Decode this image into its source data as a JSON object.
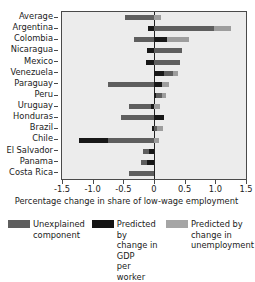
{
  "chart_data": {
    "type": "bar",
    "orientation": "horizontal",
    "stacked": true,
    "title": "",
    "xlabel": "Percentage change in share of low-wage employment",
    "ylabel": "",
    "xlim": [
      -1.5,
      1.5
    ],
    "xticks": [
      -1.5,
      -1.0,
      -0.5,
      0.0,
      0.5,
      1.0,
      1.5
    ],
    "xtick_labels": [
      "-1.5",
      "-1.0",
      "-0.5",
      "0",
      "0.5",
      "1.0",
      "1.5"
    ],
    "grid": false,
    "legend_position": "bottom",
    "zero_line": 0,
    "categories": [
      "Average",
      "Argentina",
      "Colombia",
      "Nicaragua",
      "Mexico",
      "Venezuela",
      "Paraguay",
      "Peru",
      "Uruguay",
      "Honduras",
      "Brazil",
      "Chile",
      "El Salvador",
      "Panama",
      "Costa Rica"
    ],
    "series": [
      {
        "name": "Unexplained component",
        "color": "#5e5e5e",
        "values": [
          -0.48,
          0.98,
          -0.33,
          0.45,
          0.42,
          0.31,
          -0.75,
          0.13,
          -0.4,
          -0.53,
          0.05,
          -0.75,
          -0.1,
          -0.09,
          -0.4
        ]
      },
      {
        "name": "Predicted by change in GDP per worker",
        "color": "#171717",
        "values": [
          0.0,
          -0.1,
          0.22,
          -0.12,
          -0.13,
          0.17,
          0.13,
          0.04,
          -0.05,
          0.16,
          -0.04,
          -0.47,
          -0.08,
          -0.12,
          0.0
        ]
      },
      {
        "name": "Predicted by change in unemployment",
        "color": "#9d9d9d",
        "values": [
          0.11,
          0.28,
          0.35,
          0.0,
          0.0,
          0.08,
          0.12,
          0.06,
          0.1,
          0.0,
          0.1,
          0.08,
          0.0,
          0.0,
          0.0
        ]
      }
    ],
    "bars": [
      {
        "category": "Average",
        "segments": [
          {
            "series": "Unexplained component",
            "start": -0.48,
            "end": 0.0
          },
          {
            "series": "Predicted by change in unemployment",
            "start": 0.0,
            "end": 0.11
          }
        ]
      },
      {
        "category": "Argentina",
        "segments": [
          {
            "series": "Predicted by change in GDP per worker",
            "start": -0.1,
            "end": 0.0
          },
          {
            "series": "Unexplained component",
            "start": 0.0,
            "end": 0.98
          },
          {
            "series": "Predicted by change in unemployment",
            "start": 0.98,
            "end": 1.26
          }
        ]
      },
      {
        "category": "Colombia",
        "segments": [
          {
            "series": "Unexplained component",
            "start": -0.33,
            "end": 0.0
          },
          {
            "series": "Predicted by change in GDP per worker",
            "start": 0.0,
            "end": 0.22
          },
          {
            "series": "Predicted by change in unemployment",
            "start": 0.22,
            "end": 0.57
          }
        ]
      },
      {
        "category": "Nicaragua",
        "segments": [
          {
            "series": "Predicted by change in GDP per worker",
            "start": -0.12,
            "end": 0.0
          },
          {
            "series": "Unexplained component",
            "start": 0.0,
            "end": 0.45
          }
        ]
      },
      {
        "category": "Mexico",
        "segments": [
          {
            "series": "Predicted by change in GDP per worker",
            "start": -0.13,
            "end": 0.0
          },
          {
            "series": "Unexplained component",
            "start": 0.0,
            "end": 0.42
          }
        ]
      },
      {
        "category": "Venezuela",
        "segments": [
          {
            "series": "Predicted by change in GDP per worker",
            "start": 0.0,
            "end": 0.17
          },
          {
            "series": "Unexplained component",
            "start": 0.17,
            "end": 0.31
          },
          {
            "series": "Predicted by change in unemployment",
            "start": 0.31,
            "end": 0.39
          }
        ]
      },
      {
        "category": "Paraguay",
        "segments": [
          {
            "series": "Unexplained component",
            "start": -0.75,
            "end": 0.0
          },
          {
            "series": "Predicted by change in GDP per worker",
            "start": 0.0,
            "end": 0.13
          },
          {
            "series": "Predicted by change in unemployment",
            "start": 0.13,
            "end": 0.25
          }
        ]
      },
      {
        "category": "Peru",
        "segments": [
          {
            "series": "Predicted by change in GDP per worker",
            "start": 0.0,
            "end": 0.04
          },
          {
            "series": "Unexplained component",
            "start": 0.04,
            "end": 0.13
          },
          {
            "series": "Predicted by change in unemployment",
            "start": 0.13,
            "end": 0.19
          }
        ]
      },
      {
        "category": "Uruguay",
        "segments": [
          {
            "series": "Unexplained component",
            "start": -0.4,
            "end": -0.05
          },
          {
            "series": "Predicted by change in GDP per worker",
            "start": -0.05,
            "end": 0.0
          },
          {
            "series": "Predicted by change in unemployment",
            "start": 0.0,
            "end": 0.1
          }
        ]
      },
      {
        "category": "Honduras",
        "segments": [
          {
            "series": "Unexplained component",
            "start": -0.53,
            "end": 0.0
          },
          {
            "series": "Predicted by change in GDP per worker",
            "start": 0.0,
            "end": 0.16
          }
        ]
      },
      {
        "category": "Brazil",
        "segments": [
          {
            "series": "Predicted by change in GDP per worker",
            "start": -0.04,
            "end": 0.0
          },
          {
            "series": "Unexplained component",
            "start": 0.0,
            "end": 0.05
          },
          {
            "series": "Predicted by change in unemployment",
            "start": 0.05,
            "end": 0.14
          }
        ]
      },
      {
        "category": "Chile",
        "segments": [
          {
            "series": "Predicted by change in GDP per worker",
            "start": -1.22,
            "end": -0.75
          },
          {
            "series": "Unexplained component",
            "start": -0.75,
            "end": 0.0
          },
          {
            "series": "Predicted by change in unemployment",
            "start": 0.0,
            "end": 0.08
          }
        ]
      },
      {
        "category": "El Salvador",
        "segments": [
          {
            "series": "Unexplained component",
            "start": -0.18,
            "end": -0.08
          },
          {
            "series": "Predicted by change in GDP per worker",
            "start": -0.08,
            "end": 0.0
          }
        ]
      },
      {
        "category": "Panama",
        "segments": [
          {
            "series": "Unexplained component",
            "start": -0.21,
            "end": -0.12
          },
          {
            "series": "Predicted by change in GDP per worker",
            "start": -0.12,
            "end": 0.0
          }
        ]
      },
      {
        "category": "Costa Rica",
        "segments": [
          {
            "series": "Unexplained component",
            "start": -0.4,
            "end": 0.0
          }
        ]
      }
    ]
  },
  "legend": {
    "items": [
      {
        "label_line1": "Unexplained",
        "label_line2": "component",
        "label_line3": "",
        "color": "#5e5e5e",
        "swatch": "unexplained-swatch"
      },
      {
        "label_line1": "Predicted by",
        "label_line2": "change in GDP",
        "label_line3": "per worker",
        "color": "#141414",
        "swatch": "gdp-swatch"
      },
      {
        "label_line1": "Predicted by",
        "label_line2": "change in",
        "label_line3": "unemployment",
        "color": "#a5a5a5",
        "swatch": "unemployment-swatch"
      }
    ]
  }
}
